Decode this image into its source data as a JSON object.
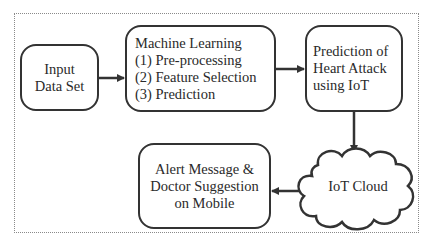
{
  "diagram": {
    "nodes": [
      {
        "id": "input",
        "lines": [
          "Input",
          "Data Set"
        ],
        "shape": "rounded-rect"
      },
      {
        "id": "ml",
        "lines": [
          "Machine Learning",
          "(1) Pre-processing",
          "(2) Feature Selection",
          "(3) Prediction"
        ],
        "shape": "rounded-rect"
      },
      {
        "id": "prediction",
        "lines": [
          "Prediction of",
          "Heart Attack",
          "using IoT"
        ],
        "shape": "rounded-rect"
      },
      {
        "id": "cloud",
        "lines": [
          "IoT Cloud"
        ],
        "shape": "cloud"
      },
      {
        "id": "alert",
        "lines": [
          "Alert Message &",
          "Doctor Suggestion",
          "on Mobile"
        ],
        "shape": "rounded-rect"
      }
    ],
    "edges": [
      {
        "from": "input",
        "to": "ml"
      },
      {
        "from": "ml",
        "to": "prediction"
      },
      {
        "from": "prediction",
        "to": "cloud"
      },
      {
        "from": "cloud",
        "to": "alert"
      }
    ],
    "colors": {
      "stroke": "#333333",
      "frame": "#8a8a8a",
      "background": "#ffffff"
    }
  }
}
